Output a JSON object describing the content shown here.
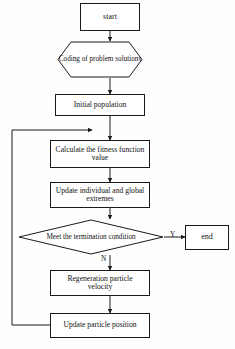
{
  "diagram": {
    "type": "flowchart",
    "line_color": "#1a1a1a",
    "background_color": "#fefefe",
    "text_color": "#111111",
    "nodes": [
      {
        "id": "start",
        "shape": "rectangle",
        "label": "start"
      },
      {
        "id": "coding",
        "shape": "hexagon",
        "label": "Coding of problem solutions"
      },
      {
        "id": "initial",
        "shape": "rectangle",
        "label": "Initial population"
      },
      {
        "id": "fitness",
        "shape": "rectangle",
        "label": "Calculate the fitness function value"
      },
      {
        "id": "extremes",
        "shape": "rectangle",
        "label": "Update individual and global extremes"
      },
      {
        "id": "termination",
        "shape": "diamond",
        "label": "Meet the termination condition"
      },
      {
        "id": "end",
        "shape": "rectangle",
        "label": "end"
      },
      {
        "id": "regeneration",
        "shape": "rectangle",
        "label": "Regeneration particle velocity"
      },
      {
        "id": "position",
        "shape": "rectangle",
        "label": "Update particle position"
      }
    ],
    "branch_labels": {
      "yes": "Y",
      "no": "N"
    }
  }
}
